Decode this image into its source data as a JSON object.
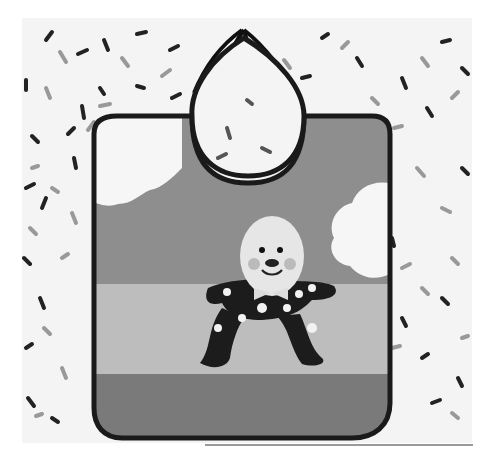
{
  "image": {
    "description": "Grayscale photo of a fabric baby bib featuring a Humpty Dumpty appliqué, laid on a white background scattered with sprinkle-like dashes",
    "subject": "Humpty Dumpty bib",
    "elements": {
      "background": "white with scattered black and gray sprinkles",
      "bib_bands": [
        "sky (mid gray)",
        "wall (light gray)",
        "ground (dark gray)"
      ],
      "clouds": [
        "left cloud",
        "right cloud"
      ],
      "character": "Humpty Dumpty with egg head, bow tie, polka-dot black suit",
      "tie": "black ties at neck"
    },
    "colors": {
      "background": "#f4f4f4",
      "sky": "#8e8e8e",
      "wall": "#bdbdbd",
      "ground": "#7a7a7a",
      "piping": "#1a1a1a",
      "cloud": "#f6f6f6",
      "suit": "#1c1c1c",
      "head": "#e6e6e6"
    }
  }
}
